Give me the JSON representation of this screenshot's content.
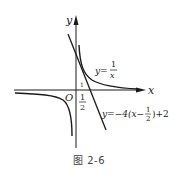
{
  "figure": {
    "caption": "图 2-6",
    "axes": {
      "x_label": "x",
      "y_label": "y",
      "origin_label": "O"
    },
    "ticks": {
      "x_half_num": "1",
      "x_half_den": "2",
      "y_small": "1"
    },
    "curves": [
      {
        "name": "hyperbola",
        "label_prefix": "y=",
        "label_num": "1",
        "label_den": "x"
      },
      {
        "name": "tangent-line",
        "label": "y=−4(x−",
        "label_num": "1",
        "label_den": "2",
        "label_suffix": ")+2"
      }
    ],
    "colors": {
      "stroke": "#1a1a1a",
      "background": "#ffffff"
    }
  }
}
